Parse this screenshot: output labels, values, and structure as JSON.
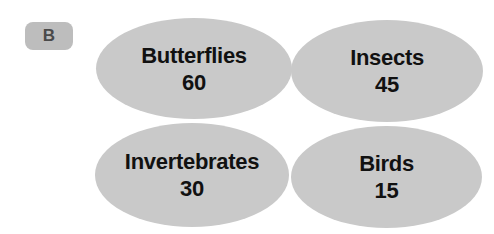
{
  "panel_label": "B",
  "colors": {
    "ellipse_fill": "#c9c9c9",
    "badge_fill": "#bdbdbd",
    "text": "#111111"
  },
  "groups": [
    {
      "label": "Butterflies",
      "value": "60"
    },
    {
      "label": "Insects",
      "value": "45"
    },
    {
      "label": "Invertebrates",
      "value": "30"
    },
    {
      "label": "Birds",
      "value": "15"
    }
  ]
}
